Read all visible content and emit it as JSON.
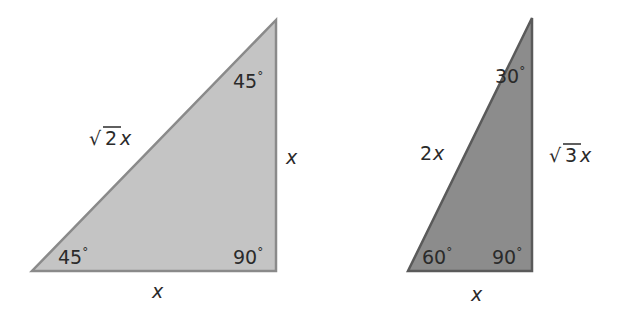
{
  "diagram": {
    "triangles": [
      {
        "name": "45-45-90 triangle",
        "fill": "#c4c4c4",
        "stroke": "#8a8a8a",
        "vertices": [
          [
            32,
            271
          ],
          [
            276,
            271
          ],
          [
            276,
            20
          ]
        ],
        "angles": {
          "bottom_left": "45°",
          "bottom_right": "90°",
          "top": "45°"
        },
        "sides": {
          "hypotenuse": "√2x",
          "vertical_leg": "x",
          "horizontal_leg": "x"
        },
        "labels": {
          "hypotenuse_radical": "√",
          "hypotenuse_coef": "2",
          "hypotenuse_var": "x",
          "vertical_leg_var": "x",
          "horizontal_leg_var": "x",
          "angle_bottom_left": "45",
          "angle_bottom_right": "90",
          "angle_top": "45",
          "degree": "°"
        }
      },
      {
        "name": "30-60-90 triangle",
        "fill": "#8c8c8c",
        "stroke": "#5a5a5a",
        "vertices": [
          [
            408,
            271
          ],
          [
            532,
            271
          ],
          [
            532,
            18
          ]
        ],
        "angles": {
          "bottom_left": "60°",
          "bottom_right": "90°",
          "top": "30°"
        },
        "sides": {
          "hypotenuse": "2x",
          "vertical_leg": "√3x",
          "horizontal_leg": "x"
        },
        "labels": {
          "hypotenuse_coef": "2",
          "hypotenuse_var": "x",
          "vertical_leg_radical": "√",
          "vertical_leg_coef": "3",
          "vertical_leg_var": "x",
          "horizontal_leg_var": "x",
          "angle_bottom_left": "60",
          "angle_bottom_right": "90",
          "angle_top": "30",
          "degree": "°"
        }
      }
    ]
  }
}
